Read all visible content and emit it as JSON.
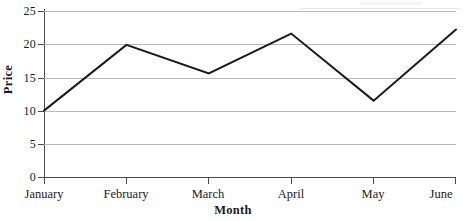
{
  "chart_data": {
    "type": "line",
    "title": "",
    "xlabel": "Month",
    "ylabel": "Price",
    "categories": [
      "January",
      "February",
      "March",
      "April",
      "May",
      "June"
    ],
    "values": [
      10.0,
      19.9,
      15.6,
      21.6,
      11.5,
      22.2
    ],
    "series": [
      {
        "name": "Price",
        "values": [
          10.0,
          19.9,
          15.6,
          21.6,
          11.5,
          22.2
        ]
      }
    ],
    "ylim": [
      0,
      25
    ],
    "ytick_labels": [
      "0",
      "5",
      "10",
      "15",
      "20",
      "25"
    ],
    "ytick_values": [
      0,
      5,
      10,
      15,
      20,
      25
    ],
    "grid": true,
    "legend": false,
    "line_color": "#1a1a1a",
    "gridline_color": "#b9b9bb",
    "axis_color": "#4a4a4a",
    "background_color": "#ffffff"
  }
}
